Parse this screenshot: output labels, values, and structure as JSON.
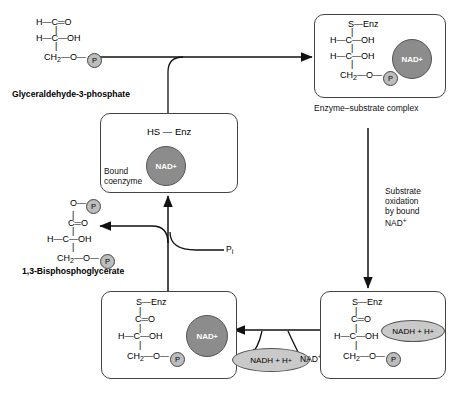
{
  "diagram": {
    "colors": {
      "nad_circle": "#8c8c8c",
      "nadh_ellipse": "#c9c9c9",
      "phosphate_circle": "#bdbdbd",
      "stroke": "#444444",
      "background": "#ffffff"
    }
  },
  "substrate": {
    "name": "Glyceraldehyde-3-phosphate",
    "lines": {
      "l1": "H—C═O",
      "l2": "H—C—OH",
      "l3_ch2": "CH",
      "l3_sub": "2",
      "l3_rest": "—O—",
      "p_label": "P"
    }
  },
  "product": {
    "name": "1,3-Bisphosphoglycerate",
    "lines": {
      "l0_o": "O—",
      "l0_p": "P",
      "l1": "C═O",
      "l2": "H—C—OH",
      "l3_ch2": "CH",
      "l3_sub": "2",
      "l3_rest": "—O—",
      "p_label": "P"
    }
  },
  "boxes": {
    "es_complex": {
      "caption": "Enzyme–substrate complex",
      "l1": "S—Enz",
      "l2": "H—C—OH",
      "l3": "H—C—OH",
      "l4_ch2": "CH",
      "l4_sub": "2",
      "l4_rest": "—O—",
      "p_label": "P",
      "cofactor": "NAD",
      "cofactor_charge": "+"
    },
    "free_enzyme": {
      "l1": "HS — Enz",
      "cofactor": "NAD",
      "cofactor_charge": "+",
      "annotation_line1": "Bound",
      "annotation_line2": "coenzyme"
    },
    "thioester": {
      "l1": "S—Enz",
      "l2": "C═O",
      "l3": "H—C—OH",
      "l4_ch2": "CH",
      "l4_sub": "2",
      "l4_rest": "—O—",
      "p_label": "P",
      "cofactor": "NAD",
      "cofactor_charge": "+"
    },
    "oxidized": {
      "l1": "S—Enz",
      "l2": "C═O",
      "l3": "H—C—OH",
      "l4_ch2": "CH",
      "l4_sub": "2",
      "l4_rest": "—O—",
      "p_label": "P",
      "cofactor": "NADH + H",
      "cofactor_charge": "+"
    }
  },
  "annotations": {
    "substrate_oxidation": {
      "line1": "Substrate",
      "line2": "oxidation",
      "line3": "by bound",
      "line4_base": "NAD",
      "line4_charge": "+"
    },
    "pi_label_base": "P",
    "pi_label_sub": "i",
    "nadh_released_base": "NADH + H",
    "nadh_released_charge": "+",
    "nad_incoming_base": "NAD",
    "nad_incoming_charge": "+"
  }
}
